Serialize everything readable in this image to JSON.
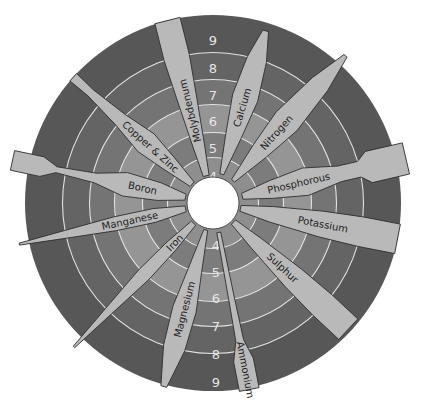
{
  "colors": {
    "background": "#ffffff",
    "petal_fill": "#b9b9b9",
    "petal_stroke": "#2e2e2e",
    "center_hole": "#ffffff",
    "ring_line": "#e4e4e4",
    "ring_text": "#e6e6e6",
    "label_text": "#1e1e1e"
  },
  "rings": [
    {
      "ph": "4",
      "color": "#8e8e8e"
    },
    {
      "ph": "5",
      "color": "#7c7c7c"
    },
    {
      "ph": "6",
      "color": "#959595"
    },
    {
      "ph": "7",
      "color": "#747474"
    },
    {
      "ph": "8",
      "color": "#646464"
    },
    {
      "ph": "9",
      "color": "#575757"
    }
  ],
  "ring_labels_top": [
    "4",
    "5",
    "6",
    "7",
    "8",
    "9"
  ],
  "ring_labels_bottom": [
    "4",
    "5",
    "6",
    "7",
    "8",
    "9"
  ],
  "nutrients": [
    {
      "name": "Molybdenum",
      "shape": "wide-outer"
    },
    {
      "name": "Calcium",
      "shape": "lens"
    },
    {
      "name": "Nitrogen",
      "shape": "lens"
    },
    {
      "name": "Phosphorous",
      "shape": "bulb"
    },
    {
      "name": "Potassium",
      "shape": "wide-outer"
    },
    {
      "name": "Sulphur",
      "shape": "wide-outer"
    },
    {
      "name": "Ammonium",
      "shape": "narrow-inner"
    },
    {
      "name": "Magnesium",
      "shape": "lens"
    },
    {
      "name": "Iron",
      "shape": "narrow-outer"
    },
    {
      "name": "Manganese",
      "shape": "narrow-outer"
    },
    {
      "name": "Boron",
      "shape": "bulb"
    },
    {
      "name": "Copper & Zinc",
      "shape": "bulb"
    }
  ]
}
